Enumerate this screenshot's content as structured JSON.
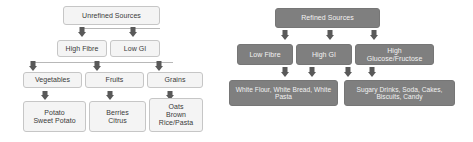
{
  "figure": {
    "background_color": "#ffffff",
    "light_node_fill": "#f4f4f4",
    "light_node_border": "#c6c6c6",
    "light_node_text": "#3a3a3a",
    "dark_node_fill": "#7f7f7f",
    "dark_node_border": "#767676",
    "dark_node_text": "#f2f2f2",
    "arrow_color": "#595959"
  },
  "diagrams": [
    {
      "id": "unrefined",
      "style": "light",
      "root": "Unrefined Sources",
      "levels": [
        {
          "nodes": [
            "Unrefined Sources"
          ]
        },
        {
          "nodes": [
            "High Fibre",
            "Low GI"
          ]
        },
        {
          "nodes": [
            "Vegetables",
            "Fruits",
            "Grains"
          ]
        },
        {
          "nodes": [
            "Potato\nSweet Potato",
            "Berries\nCitrus",
            "Oats\nBrown\nRice/Pasta"
          ]
        }
      ],
      "nodes": {
        "root": "Unrefined Sources",
        "high_fibre": "High Fibre",
        "low_gi": "Low GI",
        "vegetables": "Vegetables",
        "fruits": "Fruits",
        "grains": "Grains",
        "potato": "Potato\nSweet Potato",
        "berries": "Berries\nCitrus",
        "oats": "Oats\nBrown\nRice/Pasta"
      }
    },
    {
      "id": "refined",
      "style": "dark",
      "root": "Refined Sources",
      "levels": [
        {
          "nodes": [
            "Refined Sources"
          ]
        },
        {
          "nodes": [
            "Low Fibre",
            "High GI",
            "High\nGlucose/Fructose"
          ]
        },
        {
          "nodes": [
            "White Flour, White Bread, White Pasta",
            "Sugary Drinks, Soda, Cakes, Biscuits, Candy"
          ]
        }
      ],
      "nodes": {
        "root": "Refined Sources",
        "low_fibre": "Low Fibre",
        "high_gi": "High GI",
        "high_glucose": "High\nGlucose/Fructose",
        "white_flour": "White Flour, White Bread, White Pasta",
        "sugary_drinks": "Sugary Drinks, Soda, Cakes, Biscuits, Candy"
      }
    }
  ]
}
